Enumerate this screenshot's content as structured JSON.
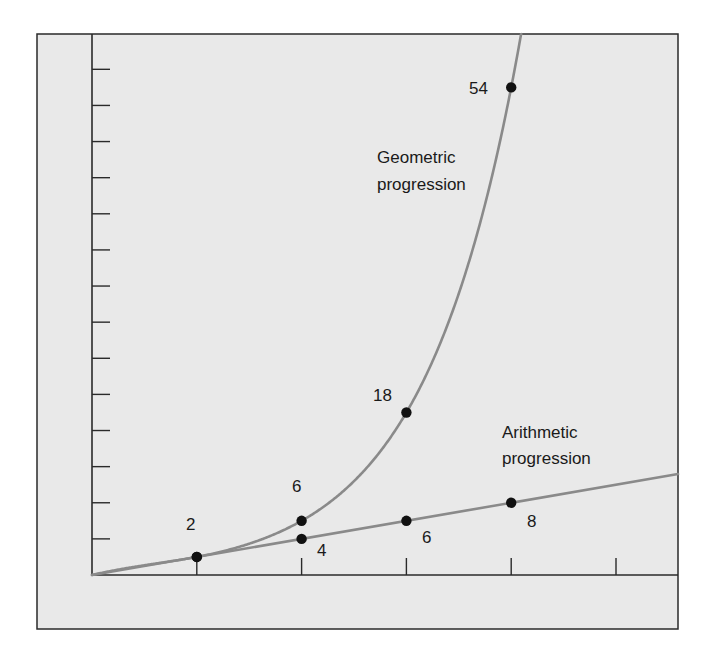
{
  "chart_data": {
    "type": "line",
    "title": "",
    "xlabel": "",
    "ylabel": "",
    "grid": false,
    "x_ticks": [
      1,
      2,
      3,
      4,
      5
    ],
    "y_tick_step": 4,
    "y_tick_count": 14,
    "xlim": [
      0,
      5.58
    ],
    "ylim": [
      0,
      56
    ],
    "series": [
      {
        "name": "Geometric progression",
        "label_lines": [
          "Geometric",
          "progression"
        ],
        "x": [
          1,
          2,
          3,
          4
        ],
        "values": [
          2,
          6,
          18,
          54
        ],
        "point_labels": [
          "2",
          "6",
          "18",
          "54"
        ]
      },
      {
        "name": "Arithmetic progression",
        "label_lines": [
          "Arithmetic",
          "progression"
        ],
        "x": [
          1,
          2,
          3,
          4
        ],
        "values": [
          2,
          4,
          6,
          8
        ],
        "point_labels": [
          "2",
          "4",
          "6",
          "8"
        ]
      }
    ],
    "colors": {
      "background": "#e9e9e9",
      "frame": "#2a2a2a",
      "curve": "#8a8a8a",
      "point": "#111111"
    }
  }
}
